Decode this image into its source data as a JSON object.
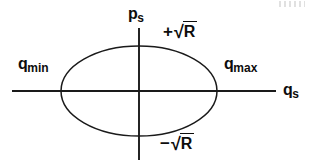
{
  "figure": {
    "title": "",
    "background_color": "#ffffff",
    "stroke_color": "#1a1a1a",
    "text_color": "#0d0d0d",
    "width": 309,
    "height": 166
  },
  "axes": {
    "horizontal": {
      "label_base": "q",
      "label_sub": "s",
      "x_start": 12,
      "x_end": 276,
      "y": 91
    },
    "vertical": {
      "label_base": "p",
      "label_sub": "s",
      "x": 139,
      "y_start": 28,
      "y_end": 160
    }
  },
  "ellipse": {
    "center_x": 139,
    "center_y": 91,
    "radius_x": 78,
    "radius_y": 45
  },
  "annotations": {
    "q_min": {
      "base": "q",
      "sub": "min"
    },
    "q_max": {
      "base": "q",
      "sub": "max"
    },
    "plus_sqrt_r": {
      "sign": "+",
      "surd": "√",
      "arg": "R"
    },
    "minus_sqrt_r": {
      "sign": "−",
      "surd": "√",
      "arg": "R"
    }
  },
  "chart_data": {
    "type": "scatter",
    "xlabel": "q_s",
    "ylabel": "p_s",
    "markers": [
      {
        "name": "q_min",
        "label": "q_min",
        "x": -1.0,
        "y": 0.0
      },
      {
        "name": "q_max",
        "label": "q_max",
        "x": 1.0,
        "y": 0.0
      },
      {
        "name": "p_top",
        "label": "+√R",
        "x": 0.0,
        "y": 1.0
      },
      {
        "name": "p_bot",
        "label": "-√R",
        "x": 0.0,
        "y": -1.0
      }
    ],
    "grid": false,
    "legend": "none"
  }
}
